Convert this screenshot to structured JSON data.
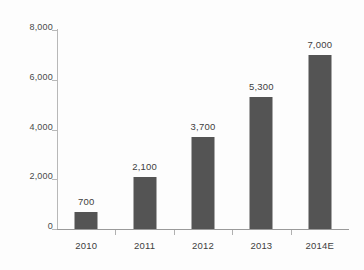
{
  "chart_data": {
    "type": "bar",
    "title": "",
    "subtitle": "",
    "xlabel": "",
    "ylabel": "",
    "categories": [
      "2010",
      "2011",
      "2012",
      "2013",
      "2014E"
    ],
    "values": [
      700,
      2100,
      3700,
      5300,
      7000
    ],
    "value_labels": [
      "700",
      "2,100",
      "3,700",
      "5,300",
      "7,000"
    ],
    "series": [
      {
        "name": "",
        "values": [
          700,
          2100,
          3700,
          5300,
          7000
        ]
      }
    ],
    "ylim": [
      0,
      8000
    ],
    "y_ticks": [
      0,
      2000,
      4000,
      6000,
      8000
    ],
    "y_tick_labels": [
      "0",
      "2,000",
      "4,000",
      "6,000",
      "8,000"
    ],
    "grid": false,
    "legend": false,
    "legend_position": "none",
    "bar_color": "#545454",
    "axis_color": "#b8b8b8",
    "text_color": "#3f3f3f",
    "background_color": "#ffffff"
  }
}
